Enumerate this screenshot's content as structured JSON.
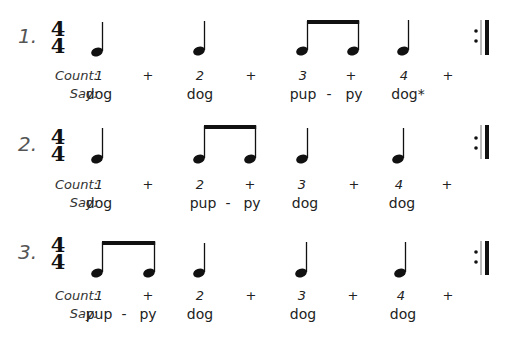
{
  "labels": {
    "count": "Count:",
    "say": "Say:"
  },
  "time_signature": {
    "top": "4",
    "bottom": "4"
  },
  "exercises": [
    {
      "number": "1.",
      "notes": [
        "quarter",
        "quarter",
        "eighth-pair",
        "quarter"
      ],
      "count": [
        "1",
        "+",
        "2",
        "+",
        "3",
        "+",
        "4",
        "+"
      ],
      "say": [
        "dog",
        "",
        "dog",
        "",
        "pup",
        "-",
        "py",
        "dog*"
      ]
    },
    {
      "number": "2.",
      "notes": [
        "quarter",
        "eighth-pair",
        "quarter",
        "quarter"
      ],
      "count": [
        "1",
        "+",
        "2",
        "+",
        "3",
        "+",
        "4",
        "+"
      ],
      "say": [
        "dog",
        "",
        "pup",
        "-",
        "py",
        "dog",
        "",
        "dog"
      ]
    },
    {
      "number": "3.",
      "notes": [
        "eighth-pair",
        "quarter",
        "quarter",
        "quarter"
      ],
      "count": [
        "1",
        "+",
        "2",
        "+",
        "3",
        "+",
        "4",
        "+"
      ],
      "say": [
        "pup",
        "-",
        "py",
        "dog",
        "",
        "dog",
        "",
        "dog"
      ]
    }
  ]
}
